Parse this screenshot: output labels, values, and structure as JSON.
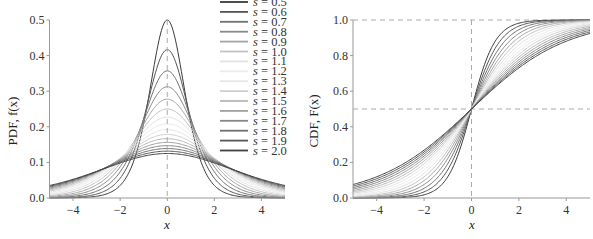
{
  "chart_data": [
    {
      "type": "line",
      "title": "",
      "xlabel": "x",
      "ylabel": "PDF, f(x)",
      "xlim": [
        -5,
        5
      ],
      "ylim": [
        0,
        0.5
      ],
      "xticks": [
        "-4",
        "-2",
        "0",
        "2",
        "4"
      ],
      "yticks": [
        "0.0",
        "0.1",
        "0.2",
        "0.3",
        "0.4",
        "0.5"
      ],
      "grid": false,
      "legend_position": "upper right",
      "reference_lines": [
        {
          "type": "vertical",
          "x": 0,
          "style": "dashed"
        }
      ],
      "function": "logistic PDF f(x) = exp(-x/s) / (s (1 + exp(-x/s))^2)",
      "series": [
        {
          "name": "s = 0.5",
          "s": 0.5,
          "peak": 0.5
        },
        {
          "name": "s = 0.6",
          "s": 0.6,
          "peak": 0.417
        },
        {
          "name": "s = 0.7",
          "s": 0.7,
          "peak": 0.357
        },
        {
          "name": "s = 0.8",
          "s": 0.8,
          "peak": 0.313
        },
        {
          "name": "s = 0.9",
          "s": 0.9,
          "peak": 0.278
        },
        {
          "name": "s = 1.0",
          "s": 1.0,
          "peak": 0.25
        },
        {
          "name": "s = 1.1",
          "s": 1.1,
          "peak": 0.227
        },
        {
          "name": "s = 1.2",
          "s": 1.2,
          "peak": 0.208
        },
        {
          "name": "s = 1.3",
          "s": 1.3,
          "peak": 0.192
        },
        {
          "name": "s = 1.4",
          "s": 1.4,
          "peak": 0.179
        },
        {
          "name": "s = 1.5",
          "s": 1.5,
          "peak": 0.167
        },
        {
          "name": "s = 1.6",
          "s": 1.6,
          "peak": 0.156
        },
        {
          "name": "s = 1.7",
          "s": 1.7,
          "peak": 0.147
        },
        {
          "name": "s = 1.8",
          "s": 1.8,
          "peak": 0.139
        },
        {
          "name": "s = 1.9",
          "s": 1.9,
          "peak": 0.132
        },
        {
          "name": "s = 2.0",
          "s": 2.0,
          "peak": 0.125
        }
      ]
    },
    {
      "type": "line",
      "title": "",
      "xlabel": "x",
      "ylabel": "CDF, F(x)",
      "xlim": [
        -5,
        5
      ],
      "ylim": [
        0,
        1.0
      ],
      "xticks": [
        "-4",
        "-2",
        "0",
        "2",
        "4"
      ],
      "yticks": [
        "0.0",
        "0.2",
        "0.4",
        "0.6",
        "0.8",
        "1.0"
      ],
      "grid": false,
      "reference_lines": [
        {
          "type": "vertical",
          "x": 0,
          "style": "dashed"
        },
        {
          "type": "horizontal",
          "y": 0.5,
          "style": "dashed"
        },
        {
          "type": "horizontal",
          "y": 1.0,
          "style": "dashed"
        }
      ],
      "function": "logistic CDF F(x) = 1 / (1 + exp(-x/s))",
      "series": [
        {
          "name": "s = 0.5",
          "s": 0.5
        },
        {
          "name": "s = 0.6",
          "s": 0.6
        },
        {
          "name": "s = 0.7",
          "s": 0.7
        },
        {
          "name": "s = 0.8",
          "s": 0.8
        },
        {
          "name": "s = 0.9",
          "s": 0.9
        },
        {
          "name": "s = 1.0",
          "s": 1.0
        },
        {
          "name": "s = 1.1",
          "s": 1.1
        },
        {
          "name": "s = 1.2",
          "s": 1.2
        },
        {
          "name": "s = 1.3",
          "s": 1.3
        },
        {
          "name": "s = 1.4",
          "s": 1.4
        },
        {
          "name": "s = 1.5",
          "s": 1.5
        },
        {
          "name": "s = 1.6",
          "s": 1.6
        },
        {
          "name": "s = 1.7",
          "s": 1.7
        },
        {
          "name": "s = 1.8",
          "s": 1.8
        },
        {
          "name": "s = 1.9",
          "s": 1.9
        },
        {
          "name": "s = 2.0",
          "s": 2.0
        }
      ]
    }
  ],
  "line_colors": [
    "#3a3a3a",
    "#555555",
    "#707070",
    "#8a8a8a",
    "#a5a5a5",
    "#c2c2c2",
    "#e2e2e2",
    "#ececec",
    "#e6e6e6",
    "#d0d0d0",
    "#b8b8b8",
    "#a0a0a0",
    "#888888",
    "#707070",
    "#585858",
    "#404040"
  ],
  "axis_color": "#999999",
  "refline_color": "#aaaaaa"
}
